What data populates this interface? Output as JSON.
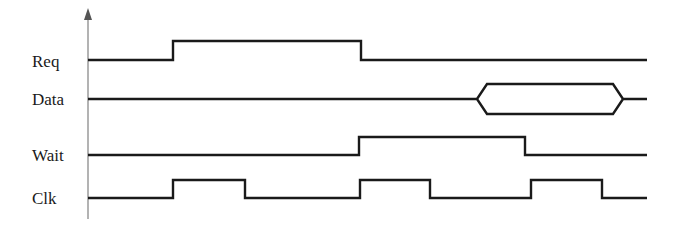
{
  "diagram": {
    "type": "timing-diagram",
    "colors": {
      "wave": "#1a1a1a",
      "axis": "#8a8a8a",
      "background": "#ffffff"
    },
    "axis": {
      "x": 88,
      "y_top": 8,
      "y_bottom": 219
    },
    "signals": [
      {
        "name": "Req",
        "label_y": 67,
        "kind": "digital",
        "high_y": 41,
        "low_y": 60,
        "start_x": 88,
        "end_x": 647,
        "initial": "low",
        "transitions": [
          173,
          361
        ]
      },
      {
        "name": "Data",
        "label_y": 105,
        "kind": "bus",
        "mid_y": 99,
        "top_y": 84,
        "bottom_y": 114,
        "start_x": 88,
        "end_x": 647,
        "valid_windows": [
          {
            "left_point": 477,
            "left_edge": 487,
            "right_edge": 613,
            "right_point": 623
          }
        ]
      },
      {
        "name": "Wait",
        "label_y": 161,
        "kind": "digital",
        "high_y": 137,
        "low_y": 155,
        "start_x": 88,
        "end_x": 647,
        "initial": "low",
        "transitions": [
          359,
          525
        ]
      },
      {
        "name": "Clk",
        "label_y": 204,
        "kind": "digital",
        "high_y": 180,
        "low_y": 198,
        "start_x": 88,
        "end_x": 647,
        "initial": "low",
        "transitions": [
          173,
          245,
          360,
          430,
          531,
          602
        ]
      }
    ]
  }
}
